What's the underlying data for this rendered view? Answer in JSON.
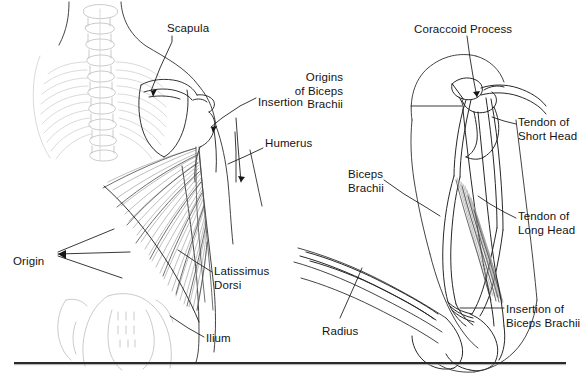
{
  "figure": {
    "type": "anatomical-illustration",
    "width": 582,
    "height": 378,
    "background_color": "#ffffff",
    "ink_color": "#131313",
    "bone_color": "#b9b9b9",
    "muscle_color": "#8e8e8e",
    "rule_color": "#2a2a2a",
    "panels": [
      {
        "name": "latissimus-dorsi-panel",
        "view": "posterior torso and shoulder",
        "subject": "Latissimus Dorsi"
      },
      {
        "name": "biceps-brachii-panel",
        "view": "lateral arm, flexed elbow",
        "subject": "Biceps Brachii"
      }
    ]
  },
  "left_panel": {
    "labels": [
      {
        "id": "scapula",
        "text": "Scapula",
        "x": 167,
        "y": 22,
        "align": "l"
      },
      {
        "id": "insertion",
        "text": "Insertion",
        "x": 258,
        "y": 96,
        "align": "l"
      },
      {
        "id": "humerus",
        "text": "Humerus",
        "x": 265,
        "y": 137,
        "align": "l"
      },
      {
        "id": "origin",
        "text": "Origin",
        "x": 13,
        "y": 255,
        "align": "l"
      },
      {
        "id": "latissimus-dorsi",
        "text": "Latissimus\nDorsi",
        "x": 214,
        "y": 265,
        "align": "l"
      },
      {
        "id": "ilium",
        "text": "Ilium",
        "x": 206,
        "y": 332,
        "align": "l"
      }
    ]
  },
  "right_panel": {
    "labels": [
      {
        "id": "coraccoid-process",
        "text": "Coraccoid Process",
        "x": 414,
        "y": 23,
        "align": "l"
      },
      {
        "id": "origins-of-biceps-brachii",
        "text": "Origins\nof Biceps\nBrachii",
        "x": 343,
        "y": 71,
        "align": "r"
      },
      {
        "id": "tendon-of-short-head",
        "text": "Tendon of\nShort Head",
        "x": 518,
        "y": 116,
        "align": "l"
      },
      {
        "id": "biceps-brachii",
        "text": "Biceps\nBrachii",
        "x": 348,
        "y": 168,
        "align": "l"
      },
      {
        "id": "tendon-of-long-head",
        "text": "Tendon of\nLong Head",
        "x": 518,
        "y": 210,
        "align": "l"
      },
      {
        "id": "insertion-of-biceps-brachii",
        "text": "Insertion of\nBiceps Brachii",
        "x": 506,
        "y": 303,
        "align": "l"
      },
      {
        "id": "radius",
        "text": "Radius",
        "x": 322,
        "y": 325,
        "align": "l"
      }
    ]
  },
  "rule": {
    "name": "bottom-divider",
    "x": 14,
    "y": 362,
    "width": 552,
    "thickness": 2
  }
}
